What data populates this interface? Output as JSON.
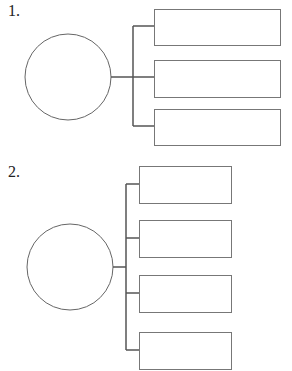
{
  "diagrams": [
    {
      "label": "1.",
      "label_pos": [
        8,
        2
      ],
      "circle": {
        "cx": 68,
        "cy": 77,
        "r": 43
      },
      "stem": {
        "x1": 111,
        "x2": 133,
        "y": 77
      },
      "bracket_x": 133,
      "boxes": [
        {
          "x": 154,
          "y": 9,
          "w": 126,
          "h": 36,
          "branch_y": 26,
          "text": ""
        },
        {
          "x": 154,
          "y": 60,
          "w": 126,
          "h": 37,
          "branch_y": 77,
          "text": ""
        },
        {
          "x": 154,
          "y": 109,
          "w": 126,
          "h": 36,
          "branch_y": 126,
          "text": ""
        }
      ]
    },
    {
      "label": "2.",
      "label_pos": [
        8,
        163
      ],
      "circle": {
        "cx": 70,
        "cy": 267,
        "r": 43
      },
      "stem": {
        "x1": 113,
        "x2": 126,
        "y": 267
      },
      "bracket_x": 126,
      "boxes": [
        {
          "x": 139,
          "y": 166,
          "w": 92,
          "h": 37,
          "branch_y": 184,
          "text": ""
        },
        {
          "x": 139,
          "y": 220,
          "w": 92,
          "h": 37,
          "branch_y": 238,
          "text": ""
        },
        {
          "x": 139,
          "y": 275,
          "w": 92,
          "h": 37,
          "branch_y": 293,
          "text": ""
        },
        {
          "x": 139,
          "y": 332,
          "w": 92,
          "h": 37,
          "branch_y": 350,
          "text": ""
        }
      ]
    }
  ],
  "colors": {
    "stroke": "#555555",
    "box_stroke": "#777777",
    "circle_stroke": "#666666"
  }
}
